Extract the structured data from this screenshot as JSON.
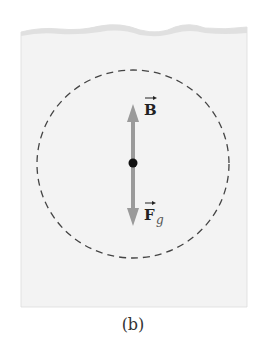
{
  "figure": {
    "caption": "(b)",
    "vectors": [
      {
        "label": "B",
        "direction": "up",
        "color": "#9a9a9a"
      },
      {
        "label": "F",
        "subscript": "g",
        "direction": "down",
        "color": "#9a9a9a"
      }
    ],
    "labels": {
      "buoyant": "B",
      "gravity": "F",
      "gravity_sub": "g"
    },
    "colors": {
      "panel": "#f3f3f3",
      "panel_top": "#e2e2e2",
      "arrow": "#9a9a9a",
      "dot": "#111111",
      "dashed_circle": "#444444"
    }
  }
}
